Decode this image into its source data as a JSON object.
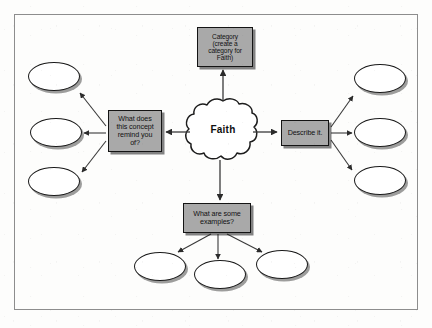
{
  "diagram": {
    "title_text": "Faith",
    "center_node": {
      "shape": "cloud",
      "label": "Faith"
    },
    "boxes": [
      {
        "id": "category",
        "label": "Category (create a category for Faith)",
        "line1": "Category",
        "line2": "(create a",
        "line3": "category for",
        "line4": "Faith)",
        "position": "top",
        "fill": "#a9a9a9",
        "stroke": "#141414"
      },
      {
        "id": "remind",
        "label": "What does this concept remind you of?",
        "line1": "What does",
        "line2": "this concept",
        "line3": "remind you",
        "line4": "of?",
        "position": "left",
        "fill": "#a9a9a9",
        "stroke": "#141414"
      },
      {
        "id": "describe",
        "label": "Describe it.",
        "line1": "Describe it.",
        "position": "right",
        "fill": "#a9a9a9",
        "stroke": "#141414"
      },
      {
        "id": "examples",
        "label": "What are some examples?",
        "line1": "What are some",
        "line2": "examples?",
        "position": "bottom",
        "fill": "#a9a9a9",
        "stroke": "#141414"
      }
    ],
    "leaf_nodes": [
      {
        "id": "left-top",
        "label": "",
        "group": "remind"
      },
      {
        "id": "left-mid",
        "label": "",
        "group": "remind"
      },
      {
        "id": "left-bottom",
        "label": "",
        "group": "remind"
      },
      {
        "id": "right-top",
        "label": "",
        "group": "describe"
      },
      {
        "id": "right-mid",
        "label": "",
        "group": "describe"
      },
      {
        "id": "right-bottom",
        "label": "",
        "group": "describe"
      },
      {
        "id": "bottom-left",
        "label": "",
        "group": "examples"
      },
      {
        "id": "bottom-center",
        "label": "",
        "group": "examples"
      },
      {
        "id": "bottom-right",
        "label": "",
        "group": "examples"
      }
    ],
    "connector_color": "#3a3a3a",
    "page_border_color": "#8d8d8d",
    "background_color": "#fdfdfc"
  }
}
